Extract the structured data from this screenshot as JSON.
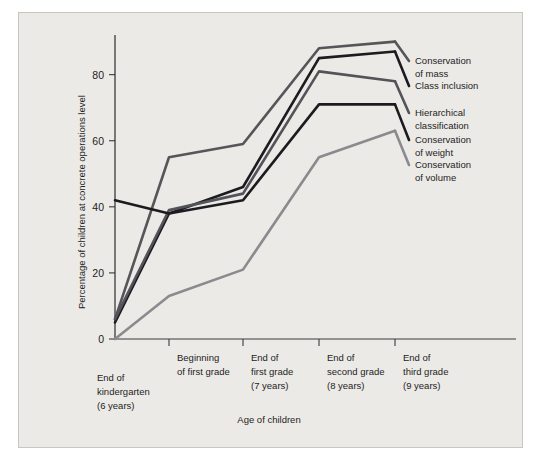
{
  "chart_data": {
    "type": "line",
    "title": "",
    "xlabel": "Age of children",
    "ylabel": "Percentage of children at concrete operations level",
    "ylim": [
      0,
      92
    ],
    "yticks": [
      0,
      20,
      40,
      60,
      80
    ],
    "ytick_labels": [
      "0",
      "20",
      "40",
      "60",
      "80"
    ],
    "grid": false,
    "legend_position": "right-inline",
    "categories": [
      "End of kindergarten (6 years)",
      "Beginning of first grade",
      "End of first grade (7 years)",
      "End of second grade (8 years)",
      "End of third grade (9 years)"
    ],
    "xtick_labels": [
      [
        "End of",
        "kindergarten",
        "(6 years)"
      ],
      [
        "Beginning",
        "of first grade"
      ],
      [
        "End of",
        "first grade",
        "(7 years)"
      ],
      [
        "End of",
        "second grade",
        "(8 years)"
      ],
      [
        "End of",
        "third grade",
        "(9 years)"
      ]
    ],
    "series": [
      {
        "name": "Conservation of mass",
        "label_lines": [
          "Conservation",
          "of mass"
        ],
        "color": "#55555a",
        "values": [
          6,
          55,
          59,
          88,
          90
        ]
      },
      {
        "name": "Class inclusion",
        "label_lines": [
          "Class inclusion"
        ],
        "color": "#1c1c20",
        "values": [
          5,
          38,
          46,
          85,
          87
        ]
      },
      {
        "name": "Hierarchical classification",
        "label_lines": [
          "Hierarchical",
          "classification"
        ],
        "color": "#53535a",
        "values": [
          6,
          39,
          44,
          81,
          78
        ]
      },
      {
        "name": "Conservation of weight",
        "label_lines": [
          "Conservation",
          "of weight"
        ],
        "color": "#1c1c20",
        "values": [
          42,
          38,
          42,
          71,
          71
        ]
      },
      {
        "name": "Conservation of volume",
        "label_lines": [
          "Conservation",
          "of volume"
        ],
        "color": "#8a8a8f",
        "values": [
          0,
          13,
          21,
          55,
          63
        ]
      }
    ]
  },
  "figure": {
    "background_color": "#eceae6",
    "axis_color": "#3a3a3a"
  }
}
